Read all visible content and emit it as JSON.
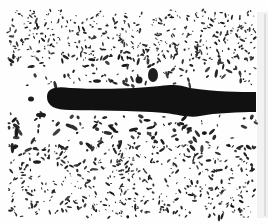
{
  "image": {
    "description": "Grayscale micrograph: a thick dark elongated stringer inclusion running horizontally through a light matrix with many dispersed small dark particles",
    "width": 268,
    "height": 224,
    "background": "#fefefe",
    "particle_color": "#1e1e1e",
    "stringer_color": "#111111",
    "side_strip_color": "#f2f2f2"
  },
  "micrograph_area": {
    "x": 8,
    "y": 10,
    "w": 248,
    "h": 208
  },
  "stringer": {
    "path": "M47,97 C47,88 56,86 70,88 C110,90 140,88 160,86 C175,84 180,85 190,88 C215,92 240,92 256,92 L256,112 C240,112 215,113 200,116 C190,118 180,115 165,113 C130,110 95,111 70,110 C55,110 47,106 47,97 Z"
  },
  "large_particles": [
    {
      "cx": 153,
      "cy": 75,
      "rx": 5,
      "ry": 7
    },
    {
      "cx": 139,
      "cy": 80,
      "rx": 3.5,
      "ry": 3.5
    },
    {
      "cx": 31,
      "cy": 99,
      "rx": 3,
      "ry": 2.5
    },
    {
      "cx": 97,
      "cy": 81,
      "rx": 4,
      "ry": 1.8
    },
    {
      "cx": 41,
      "cy": 115,
      "rx": 5,
      "ry": 2.2
    },
    {
      "cx": 37,
      "cy": 162,
      "rx": 4,
      "ry": 1.8
    }
  ],
  "particle_field": {
    "seed": 1337,
    "bands": [
      {
        "y0": 10,
        "y1": 60,
        "count": 420,
        "min": 0.6,
        "max": 1.8
      },
      {
        "y0": 55,
        "y1": 86,
        "count": 110,
        "min": 0.8,
        "max": 2.6
      },
      {
        "y0": 113,
        "y1": 150,
        "count": 150,
        "min": 0.8,
        "max": 3.0
      },
      {
        "y0": 145,
        "y1": 218,
        "count": 520,
        "min": 0.6,
        "max": 2.0
      }
    ],
    "x0": 8,
    "x1": 256
  }
}
